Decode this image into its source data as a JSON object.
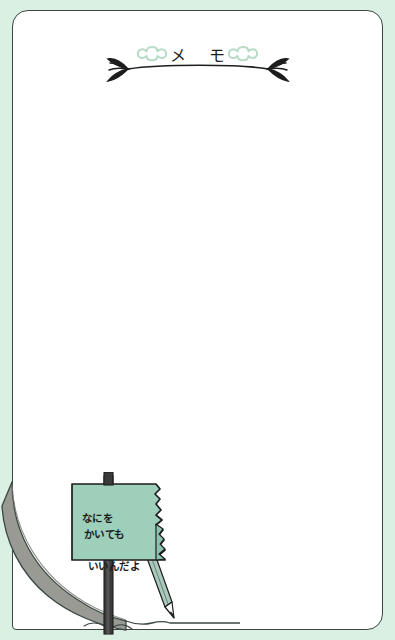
{
  "page": {
    "bg_color": "#d9f0e2",
    "paper_color": "#ffffff",
    "ink_color": "#3b4742"
  },
  "header": {
    "title": "メ モ",
    "left_ornament": "leaf-flourish-icon",
    "right_ornament": "leaf-flourish-icon",
    "left_clover": "clover-icon",
    "right_clover": "clover-icon",
    "clover_color": "#b9dcc9"
  },
  "body": {
    "placeholder": "",
    "value": ""
  },
  "sign": {
    "line1": "なにを",
    "line2": "かいても",
    "line3": "いいんだよ",
    "board_color": "#9ecfba",
    "post_color": "#3a3a3a"
  },
  "decor": {
    "curl_color": "#9a9a95",
    "curl_shadow": "#8b8b86",
    "pencil_body": "#a9c9bd",
    "pencil_tip": "#2b2b2b"
  }
}
